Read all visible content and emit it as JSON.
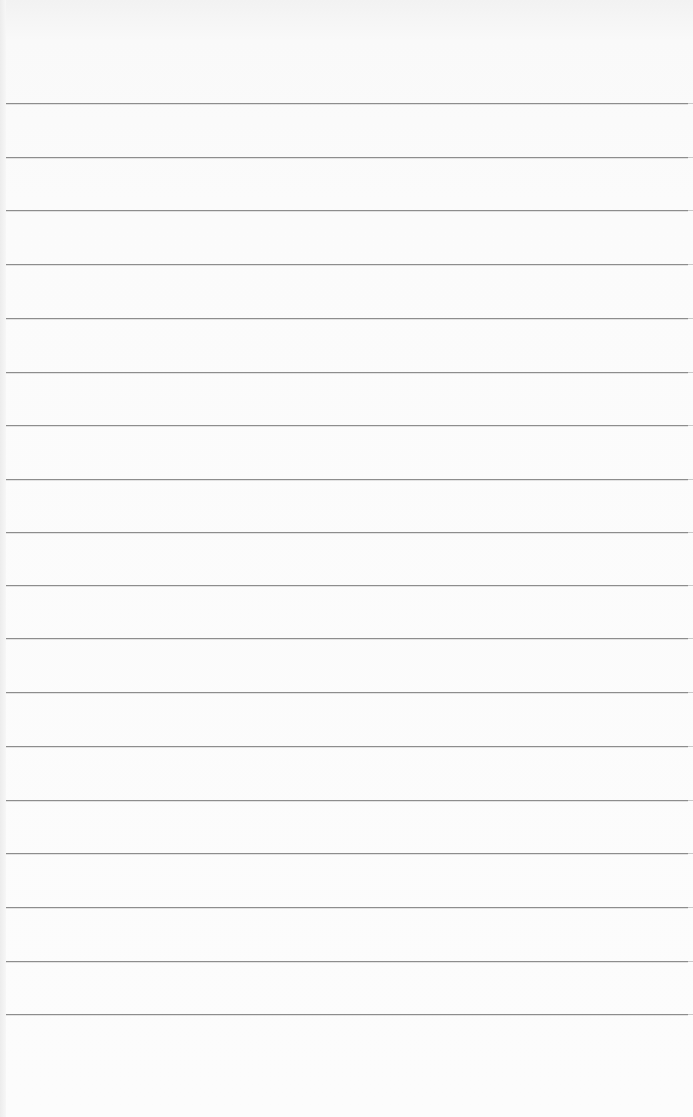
{
  "page": {
    "type": "blank ruled notepad page",
    "background_color": "#fbfbfb",
    "rule_color": "#8d8d8d",
    "rule_count": 18,
    "rules_y": [
      103,
      157,
      210,
      264,
      318,
      372,
      425,
      479,
      532,
      585,
      638,
      692,
      746,
      800,
      853,
      907,
      961,
      1014
    ]
  }
}
